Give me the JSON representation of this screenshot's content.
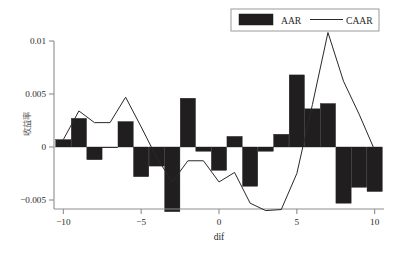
{
  "chart_data": {
    "type": "bar",
    "title": "",
    "subtitle": "",
    "xlabel": "dif",
    "ylabel": "收益率",
    "x": [
      -10,
      -9,
      -8,
      -7,
      -6,
      -5,
      -4,
      -3,
      -2,
      -1,
      0,
      1,
      2,
      3,
      4,
      5,
      6,
      7,
      8,
      9,
      10
    ],
    "xlim": [
      -10.6,
      10.6
    ],
    "ylim": [
      -0.0065,
      0.0115
    ],
    "xticks": [
      -10,
      -5,
      0,
      5,
      10
    ],
    "xticklabels": [
      "−10",
      "−5",
      "0",
      "5",
      "10"
    ],
    "yticks": [
      -0.005,
      0,
      0.005,
      0.01
    ],
    "yticklabels": [
      "−0.005",
      "0",
      "0.005",
      "0.01"
    ],
    "grid": false,
    "legend_position": "top-right",
    "series": [
      {
        "name": "AAR",
        "type": "bar",
        "color": "#201e1e",
        "values": [
          0.0007,
          0.0027,
          -0.0012,
          -5e-05,
          0.0024,
          -0.0028,
          -0.0018,
          -0.0061,
          0.0046,
          -0.0004,
          -0.0022,
          0.001,
          -0.0037,
          -0.0004,
          0.0012,
          0.0068,
          0.0036,
          0.0041,
          -0.0053,
          -0.0038,
          -0.0042
        ]
      },
      {
        "name": "CAAR",
        "type": "line",
        "color": "#2a2828",
        "values": [
          0.0007,
          0.0034,
          0.0023,
          0.0023,
          0.0047,
          0.0019,
          -0.001,
          -0.0033,
          -0.0013,
          -0.0013,
          -0.0033,
          -0.0024,
          -0.0053,
          -0.006,
          -0.0059,
          -0.0025,
          0.004,
          0.0108,
          0.0062,
          0.0031,
          -0.0003
        ]
      }
    ]
  },
  "legend": {
    "items": [
      {
        "label": "AAR",
        "marker": "filled-rect-swatch"
      },
      {
        "label": "CAAR",
        "marker": "line-swatch"
      }
    ]
  },
  "axes": {
    "x_title": "dif",
    "y_title": "收益率"
  }
}
